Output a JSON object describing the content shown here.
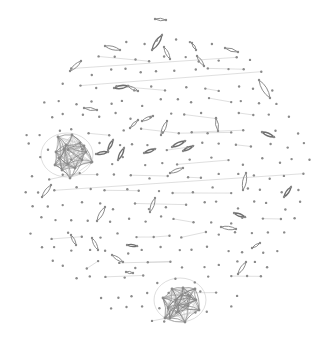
{
  "graph": {
    "type": "force-directed network",
    "background": "#ffffff",
    "node_color": "#8a8a8a",
    "edge_color": "#8c8c8c",
    "layout": {
      "center": [
        165,
        178
      ],
      "radius": 150,
      "grid_step": 17,
      "node_radius": 1.2
    },
    "lenses": [
      {
        "x1": 155,
        "y1": 19,
        "x2": 166,
        "y2": 20,
        "strong": false
      },
      {
        "x1": 152,
        "y1": 50,
        "x2": 162,
        "y2": 35,
        "strong": true
      },
      {
        "x1": 164,
        "y1": 47,
        "x2": 170,
        "y2": 59,
        "strong": false
      },
      {
        "x1": 105,
        "y1": 46,
        "x2": 120,
        "y2": 50,
        "strong": false
      },
      {
        "x1": 70,
        "y1": 71,
        "x2": 81,
        "y2": 61,
        "strong": false
      },
      {
        "x1": 114,
        "y1": 88,
        "x2": 128,
        "y2": 86,
        "strong": true
      },
      {
        "x1": 128,
        "y1": 86,
        "x2": 138,
        "y2": 91,
        "strong": false
      },
      {
        "x1": 225,
        "y1": 48,
        "x2": 238,
        "y2": 52,
        "strong": false
      },
      {
        "x1": 259,
        "y1": 80,
        "x2": 270,
        "y2": 98,
        "strong": false
      },
      {
        "x1": 84,
        "y1": 108,
        "x2": 97,
        "y2": 110,
        "strong": false
      },
      {
        "x1": 96,
        "y1": 154,
        "x2": 108,
        "y2": 152,
        "strong": true
      },
      {
        "x1": 118,
        "y1": 160,
        "x2": 124,
        "y2": 148,
        "strong": true
      },
      {
        "x1": 108,
        "y1": 150,
        "x2": 113,
        "y2": 140,
        "strong": true
      },
      {
        "x1": 144,
        "y1": 153,
        "x2": 155,
        "y2": 149,
        "strong": true
      },
      {
        "x1": 161,
        "y1": 135,
        "x2": 167,
        "y2": 121,
        "strong": false
      },
      {
        "x1": 262,
        "y1": 132,
        "x2": 274,
        "y2": 137,
        "strong": true
      },
      {
        "x1": 130,
        "y1": 128,
        "x2": 138,
        "y2": 120,
        "strong": false
      },
      {
        "x1": 142,
        "y1": 121,
        "x2": 153,
        "y2": 116,
        "strong": false
      },
      {
        "x1": 170,
        "y1": 173,
        "x2": 183,
        "y2": 168,
        "strong": false
      },
      {
        "x1": 172,
        "y1": 147,
        "x2": 185,
        "y2": 141,
        "strong": true
      },
      {
        "x1": 183,
        "y1": 151,
        "x2": 193,
        "y2": 146,
        "strong": true
      },
      {
        "x1": 243,
        "y1": 190,
        "x2": 246,
        "y2": 173,
        "strong": false
      },
      {
        "x1": 284,
        "y1": 197,
        "x2": 291,
        "y2": 187,
        "strong": true
      },
      {
        "x1": 234,
        "y1": 213,
        "x2": 245,
        "y2": 217,
        "strong": true
      },
      {
        "x1": 221,
        "y1": 227,
        "x2": 236,
        "y2": 229,
        "strong": false
      },
      {
        "x1": 42,
        "y1": 197,
        "x2": 51,
        "y2": 185,
        "strong": false
      },
      {
        "x1": 97,
        "y1": 221,
        "x2": 105,
        "y2": 207,
        "strong": false
      },
      {
        "x1": 150,
        "y1": 212,
        "x2": 155,
        "y2": 198,
        "strong": false
      },
      {
        "x1": 71,
        "y1": 235,
        "x2": 76,
        "y2": 245,
        "strong": false
      },
      {
        "x1": 92,
        "y1": 238,
        "x2": 98,
        "y2": 250,
        "strong": false
      },
      {
        "x1": 127,
        "y1": 245,
        "x2": 137,
        "y2": 246,
        "strong": true
      },
      {
        "x1": 112,
        "y1": 255,
        "x2": 123,
        "y2": 262,
        "strong": false
      },
      {
        "x1": 126,
        "y1": 272,
        "x2": 133,
        "y2": 273,
        "strong": false
      },
      {
        "x1": 252,
        "y1": 248,
        "x2": 260,
        "y2": 243,
        "strong": false
      },
      {
        "x1": 238,
        "y1": 274,
        "x2": 246,
        "y2": 262,
        "strong": false
      },
      {
        "x1": 216,
        "y1": 118,
        "x2": 218,
        "y2": 131,
        "strong": false
      },
      {
        "x1": 197,
        "y1": 56,
        "x2": 204,
        "y2": 66,
        "strong": false
      },
      {
        "x1": 192,
        "y1": 43,
        "x2": 196,
        "y2": 50,
        "strong": false
      }
    ],
    "clusters": [
      {
        "name": "left-cluster",
        "center": [
          67,
          155
        ],
        "nodes": [
          [
            58,
            137
          ],
          [
            72,
            135
          ],
          [
            84,
            146
          ],
          [
            80,
            143
          ],
          [
            64,
            149
          ],
          [
            56,
            152
          ],
          [
            55,
            165
          ],
          [
            62,
            170
          ],
          [
            68,
            164
          ],
          [
            75,
            168
          ],
          [
            82,
            160
          ],
          [
            86,
            152
          ],
          [
            70,
            178
          ],
          [
            92,
            162
          ],
          [
            66,
            145
          ],
          [
            60,
            158
          ]
        ]
      },
      {
        "name": "bottom-cluster",
        "center": [
          180,
          300
        ],
        "nodes": [
          [
            172,
            289
          ],
          [
            183,
            288
          ],
          [
            190,
            296
          ],
          [
            188,
            306
          ],
          [
            178,
            312
          ],
          [
            168,
            308
          ],
          [
            163,
            298
          ],
          [
            176,
            300
          ],
          [
            182,
            295
          ],
          [
            170,
            318
          ],
          [
            185,
            322
          ],
          [
            196,
            300
          ],
          [
            195,
            289
          ],
          [
            165,
            318
          ],
          [
            199,
            310
          ],
          [
            178,
            305
          ]
        ]
      }
    ]
  }
}
